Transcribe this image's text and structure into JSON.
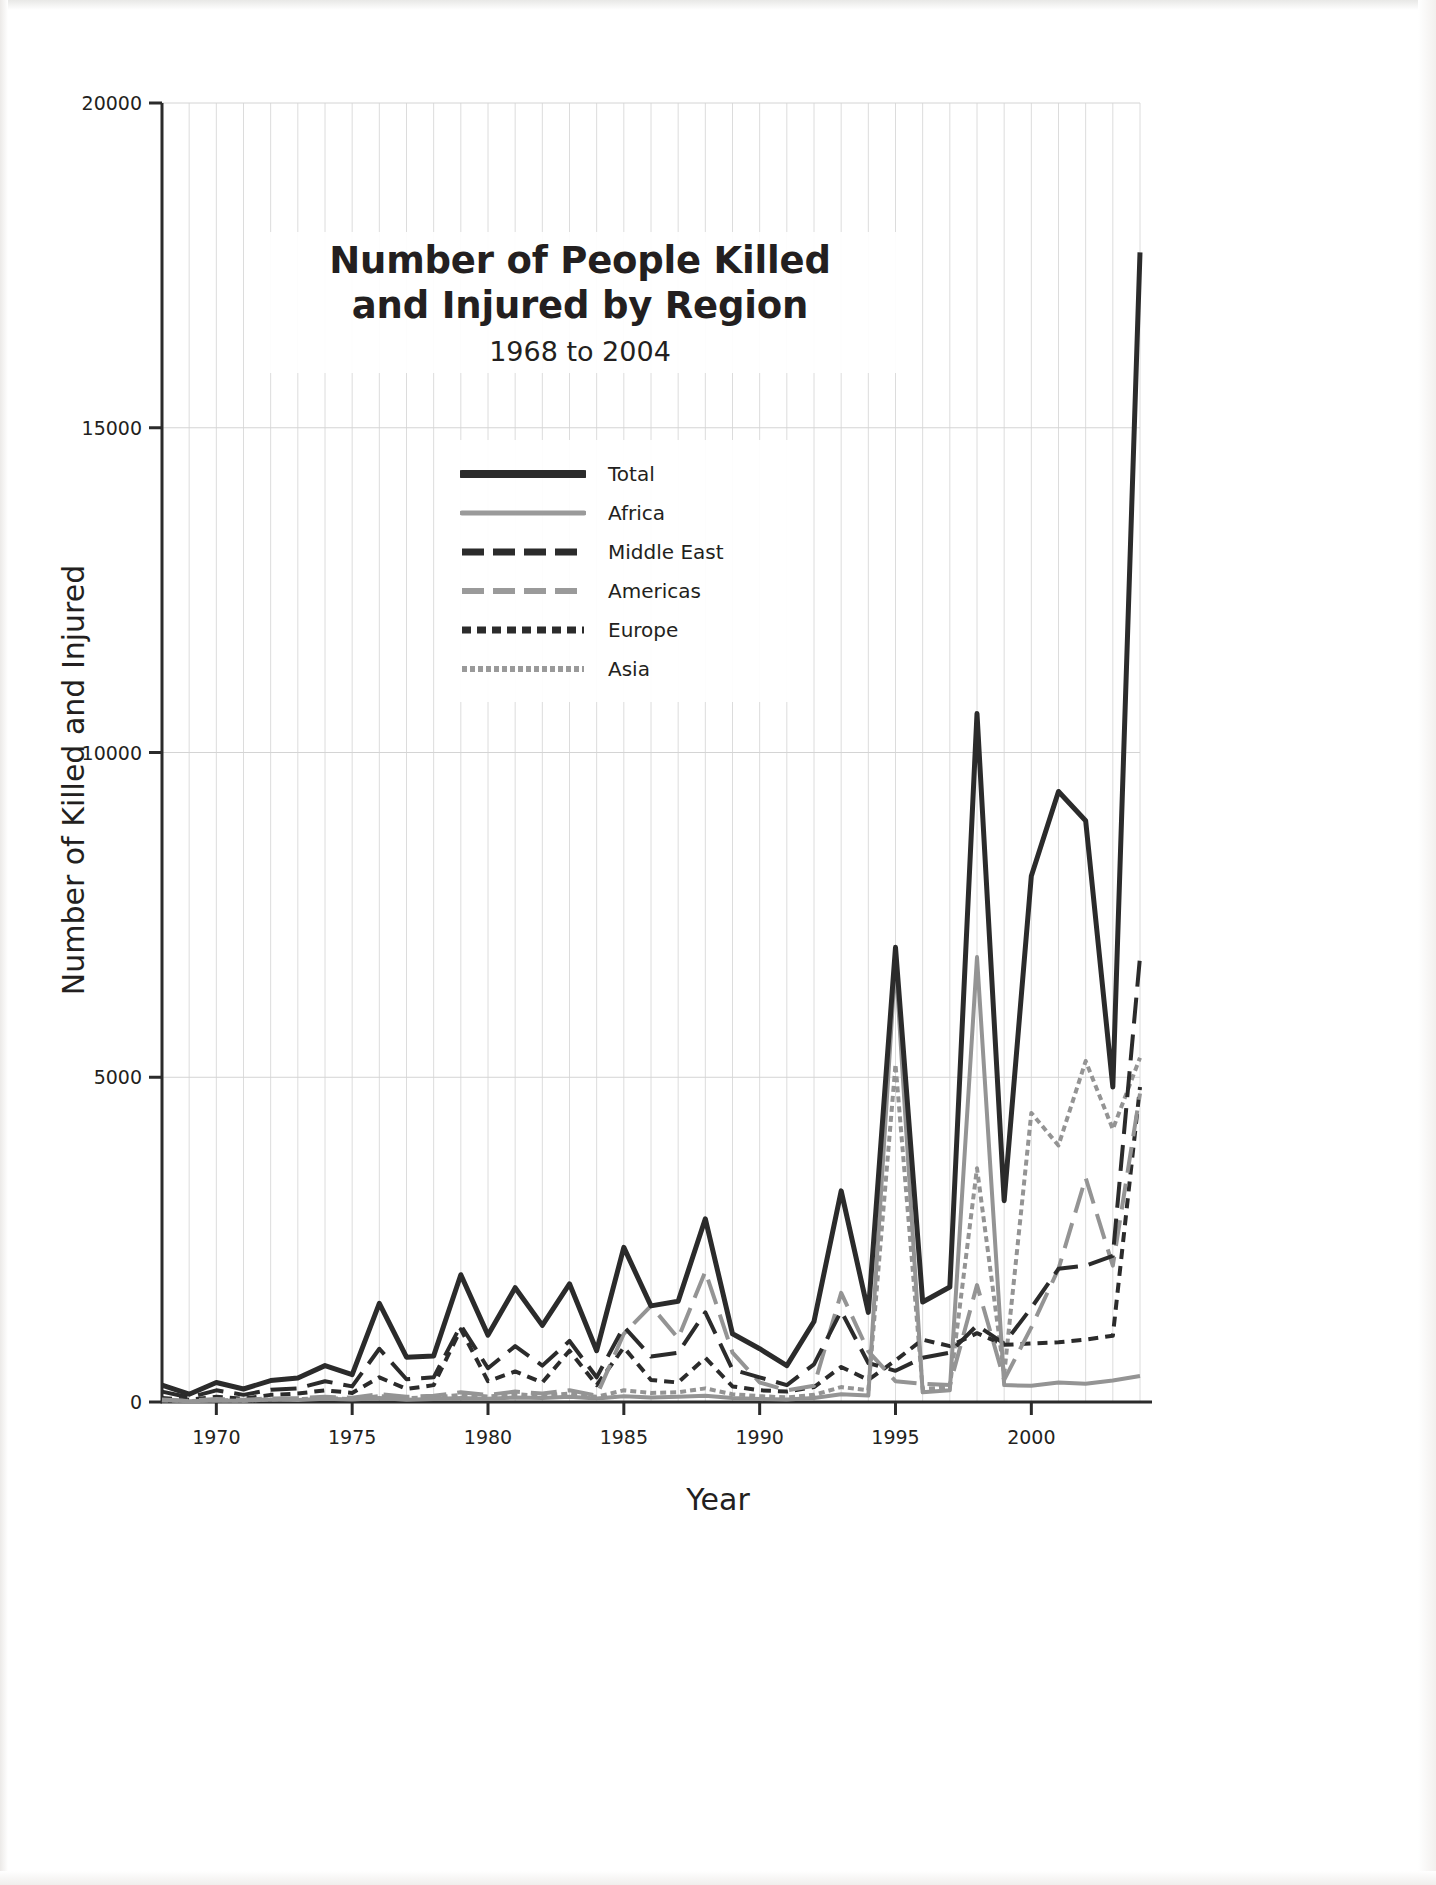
{
  "chart_data": {
    "type": "line",
    "title": "Number of People Killed\nand Injured by Region",
    "subtitle": "1968 to 2004",
    "xlabel": "Year",
    "ylabel": "Number of Killed and Injured",
    "xlim": [
      1968,
      2004
    ],
    "ylim": [
      0,
      20000
    ],
    "yticks": [
      0,
      5000,
      10000,
      15000,
      20000
    ],
    "ytick_labels": [
      "0",
      "5000",
      "10000",
      "15000",
      "20000"
    ],
    "xticks": [
      1970,
      1975,
      1980,
      1985,
      1990,
      1995,
      2000
    ],
    "xtick_labels": [
      "1970",
      "1975",
      "1980",
      "1985",
      "1990",
      "1995",
      "2000"
    ],
    "grid": "vertical-minor-and-horizontal-major",
    "legend_position": "upper-center",
    "x": [
      1968,
      1969,
      1970,
      1971,
      1972,
      1973,
      1974,
      1975,
      1976,
      1977,
      1978,
      1979,
      1980,
      1981,
      1982,
      1983,
      1984,
      1985,
      1986,
      1987,
      1988,
      1989,
      1990,
      1991,
      1992,
      1993,
      1994,
      1995,
      1996,
      1997,
      1998,
      1999,
      2000,
      2001,
      2002,
      2003,
      2004
    ],
    "series": [
      {
        "name": "Total",
        "style": "solid",
        "color": "#2b2b2b",
        "width": 5,
        "values": [
          260,
          120,
          300,
          200,
          330,
          370,
          560,
          420,
          1520,
          690,
          710,
          1960,
          1030,
          1760,
          1180,
          1820,
          790,
          2380,
          1480,
          1550,
          2820,
          1050,
          820,
          560,
          1240,
          3250,
          1380,
          7000,
          1540,
          1770,
          10600,
          3100,
          8100,
          9400,
          8950,
          4850,
          17700
        ]
      },
      {
        "name": "Africa",
        "style": "solid",
        "color": "#949494",
        "width": 4,
        "values": [
          30,
          10,
          25,
          20,
          40,
          30,
          50,
          40,
          60,
          35,
          45,
          60,
          50,
          70,
          60,
          80,
          55,
          90,
          70,
          80,
          95,
          60,
          45,
          40,
          60,
          120,
          100,
          6800,
          150,
          180,
          6850,
          260,
          250,
          300,
          280,
          330,
          400
        ]
      },
      {
        "name": "Middle East",
        "style": "dashed",
        "color": "#2b2b2b",
        "width": 4,
        "values": [
          160,
          70,
          180,
          110,
          190,
          210,
          320,
          240,
          820,
          350,
          380,
          1180,
          520,
          860,
          560,
          940,
          380,
          1160,
          700,
          760,
          1380,
          500,
          380,
          260,
          580,
          1400,
          600,
          480,
          680,
          760,
          1180,
          900,
          1450,
          2050,
          2100,
          2250,
          6850
        ]
      },
      {
        "name": "Americas",
        "style": "dashed",
        "color": "#949494",
        "width": 4,
        "values": [
          40,
          20,
          45,
          35,
          55,
          60,
          80,
          65,
          120,
          80,
          95,
          150,
          110,
          160,
          130,
          180,
          100,
          1050,
          1480,
          980,
          2010,
          760,
          300,
          180,
          250,
          1680,
          780,
          320,
          280,
          260,
          1800,
          340,
          1150,
          2050,
          3450,
          2100,
          4750
        ]
      },
      {
        "name": "Europe",
        "style": "dotted",
        "color": "#2b2b2b",
        "width": 4,
        "values": [
          60,
          35,
          80,
          50,
          110,
          130,
          180,
          140,
          380,
          200,
          260,
          1120,
          320,
          470,
          300,
          790,
          260,
          840,
          340,
          300,
          680,
          240,
          180,
          160,
          230,
          540,
          340,
          640,
          960,
          860,
          1060,
          880,
          900,
          920,
          960,
          1020,
          4850
        ]
      },
      {
        "name": "Asia",
        "style": "fine-dotted",
        "color": "#949494",
        "width": 4,
        "values": [
          25,
          15,
          30,
          20,
          40,
          45,
          60,
          45,
          90,
          60,
          70,
          110,
          85,
          120,
          95,
          130,
          80,
          180,
          140,
          150,
          210,
          120,
          90,
          70,
          110,
          230,
          180,
          5200,
          200,
          230,
          3600,
          420,
          4450,
          3950,
          5250,
          4200,
          5300
        ]
      }
    ]
  },
  "legend": {
    "items": [
      {
        "label": "Total"
      },
      {
        "label": "Africa"
      },
      {
        "label": "Middle East"
      },
      {
        "label": "Americas"
      },
      {
        "label": "Europe"
      },
      {
        "label": "Asia"
      }
    ]
  }
}
